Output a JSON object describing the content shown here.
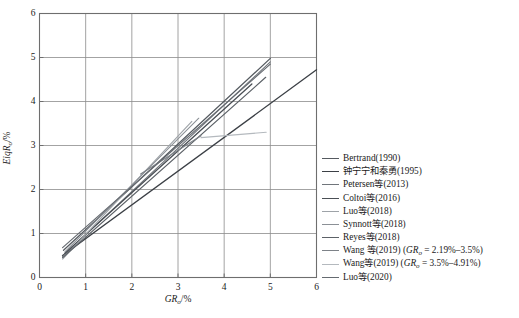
{
  "chart_data": {
    "type": "line",
    "title": "",
    "xlabel": "GRo/%",
    "ylabel": "EiqRo/%",
    "xlabel_parts": {
      "main": "GR",
      "sub": "o",
      "unit": "/%"
    },
    "ylabel_parts": {
      "main": "EiqR",
      "sub": "o",
      "unit": "/%"
    },
    "xlim": [
      0,
      6
    ],
    "ylim": [
      0,
      6
    ],
    "xticks": [
      0,
      1,
      2,
      3,
      4,
      5,
      6
    ],
    "yticks": [
      0,
      1,
      2,
      3,
      4,
      5,
      6
    ],
    "xtick_labels": [
      "0",
      "1",
      "2",
      "3",
      "4",
      "5",
      "6"
    ],
    "ytick_labels": [
      "0",
      "1",
      "2",
      "3",
      "4",
      "5",
      "6"
    ],
    "grid": true,
    "grid_color": "#8c8c8c",
    "frame_color": "#6e6e6e",
    "legend_position": "right-outside",
    "series": [
      {
        "name": "Bertrand(1990)",
        "color": "#555a60",
        "width": 1.25,
        "x": [
          0.52,
          5.0
        ],
        "y": [
          0.62,
          4.98
        ]
      },
      {
        "name": "钟宁宁和秦勇(1995)",
        "color": "#3c4046",
        "width": 1.35,
        "x": [
          0.5,
          6.0
        ],
        "y": [
          0.5,
          4.72
        ]
      },
      {
        "name": "Petersen等(2013)",
        "color": "#70757b",
        "width": 1.15,
        "x": [
          0.5,
          5.0
        ],
        "y": [
          0.48,
          4.9
        ]
      },
      {
        "name": "Coltoi等(2016)",
        "color": "#4a4f55",
        "width": 1.3,
        "x": [
          0.55,
          4.6
        ],
        "y": [
          0.55,
          4.4
        ]
      },
      {
        "name": "Luo等(2018)",
        "color": "#9ea3a8",
        "width": 1.1,
        "x": [
          0.5,
          3.3
        ],
        "y": [
          0.42,
          3.55
        ]
      },
      {
        "name": "Synnott等(2018)",
        "color": "#8b9096",
        "width": 1.1,
        "x": [
          0.55,
          3.45
        ],
        "y": [
          0.58,
          3.62
        ]
      },
      {
        "name": "Reyes等(2018)",
        "color": "#5c6167",
        "width": 1.2,
        "x": [
          0.5,
          4.9
        ],
        "y": [
          0.45,
          4.55
        ]
      },
      {
        "name": "Wang 等(2019) (GRo = 2.19%-3.5%)",
        "color": "#7d8288",
        "width": 1.15,
        "x": [
          2.19,
          3.5
        ],
        "y": [
          2.35,
          3.22
        ]
      },
      {
        "name": "Wang等(2019) (GRo = 3.5%-4.91%)",
        "color": "#b4b9be",
        "width": 1.15,
        "x": [
          3.5,
          4.91
        ],
        "y": [
          3.18,
          3.3
        ]
      },
      {
        "name": "Luo等(2020)",
        "color": "#656a70",
        "width": 1.2,
        "x": [
          0.5,
          5.0
        ],
        "y": [
          0.68,
          4.85
        ]
      }
    ]
  },
  "legend": {
    "entries": [
      {
        "label": "Bertrand(1990)",
        "color": "#555a60"
      },
      {
        "label": "钟宁宁和秦勇(1995)",
        "color": "#3c4046"
      },
      {
        "label": "Petersen等(2013)",
        "color": "#70757b"
      },
      {
        "label": "Coltoi等(2016)",
        "color": "#4a4f55"
      },
      {
        "label": "Luo等(2018)",
        "color": "#9ea3a8"
      },
      {
        "label": "Synnott等(2018)",
        "color": "#8b9096"
      },
      {
        "label": "Reyes等(2018)",
        "color": "#5c6167"
      },
      {
        "label": "Wang 等(2019) (GRo = 2.19%–3.5%)",
        "color": "#7d8288",
        "rich": {
          "pre": "Wang 等(2019) (",
          "var": "GR",
          "sub": "o",
          "post": " = 2.19%–3.5%)"
        }
      },
      {
        "label": "Wang等(2019) (GRo = 3.5%–4.91%)",
        "color": "#b4b9be",
        "rich": {
          "pre": "Wang等(2019) (",
          "var": "GR",
          "sub": "o",
          "post": " = 3.5%–4.91%)"
        }
      },
      {
        "label": "Luo等(2020)",
        "color": "#656a70"
      }
    ]
  }
}
